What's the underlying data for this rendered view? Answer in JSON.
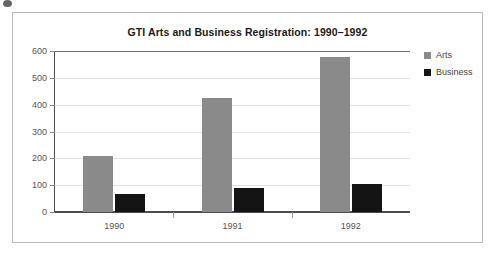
{
  "chart_data": {
    "type": "bar",
    "title": "GTI Arts and Business Registration: 1990–1992",
    "xlabel": "",
    "ylabel": "",
    "categories": [
      "1990",
      "1991",
      "1992"
    ],
    "series": [
      {
        "name": "Arts",
        "color": "#8a8a8a",
        "values": [
          209,
          425,
          578
        ]
      },
      {
        "name": "Business",
        "color": "#141414",
        "values": [
          67,
          89,
          104
        ]
      }
    ],
    "ylim": [
      0,
      600
    ],
    "yticks": [
      0,
      100,
      200,
      300,
      400,
      500,
      600
    ],
    "ytick_labels": [
      "0",
      "100",
      "200",
      "300",
      "400",
      "500",
      "600"
    ],
    "grid": true,
    "legend_position": "right"
  },
  "legend": {
    "items": [
      {
        "label": "Arts",
        "swatch": "#8a8a8a"
      },
      {
        "label": "Business",
        "swatch": "#141414"
      }
    ]
  }
}
